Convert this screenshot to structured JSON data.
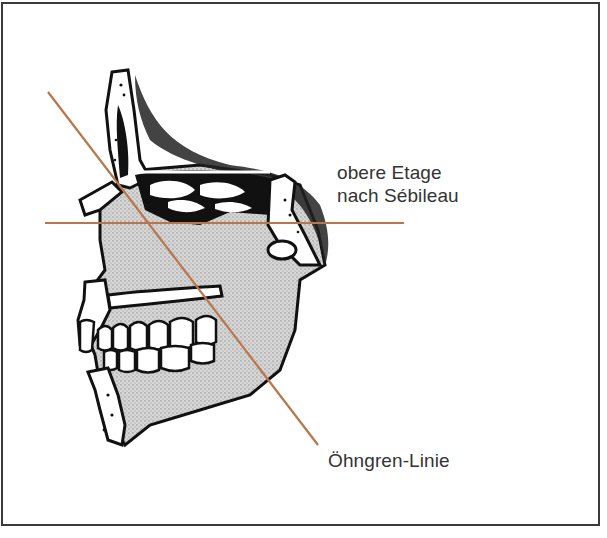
{
  "figure": {
    "labels": {
      "upper_line_1": "obere Etage",
      "upper_line_2": "nach Sébileau",
      "diagonal": "Öhngren-Linie"
    },
    "lines": {
      "color": "#b8764a",
      "horizontal": {
        "x1": 45,
        "y1": 223,
        "x2": 404,
        "y2": 223
      },
      "diagonal": {
        "x1": 48,
        "y1": 92,
        "x2": 318,
        "y2": 445
      }
    },
    "colors": {
      "border": "#3a3a3a",
      "bone_fill": "#cfcfcf",
      "ink": "#111111",
      "text": "#333333"
    }
  }
}
